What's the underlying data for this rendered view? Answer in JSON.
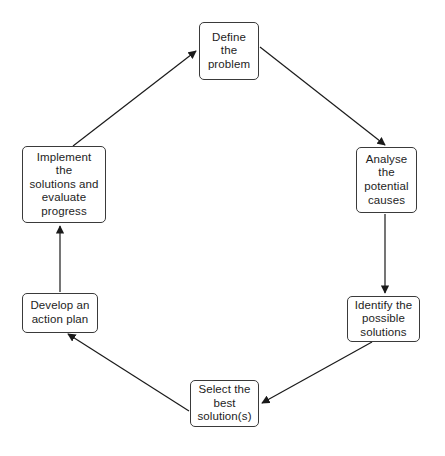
{
  "diagram": {
    "type": "cycle-flowchart",
    "background_color": "#ffffff",
    "node_border_color": "#3a3a3a",
    "arrow_color": "#1a1a1a",
    "text_color": "#1d1d1d",
    "nodes": [
      {
        "id": "define",
        "label": "Define\nthe\nproblem"
      },
      {
        "id": "analyse",
        "label": "Analyse\nthe\npotential\ncauses"
      },
      {
        "id": "identify",
        "label": "Identify the\npossible\nsolutions"
      },
      {
        "id": "select",
        "label": "Select the\nbest\nsolution(s)"
      },
      {
        "id": "develop",
        "label": "Develop an\naction plan"
      },
      {
        "id": "implement",
        "label": "Implement\nthe\nsolutions and\nevaluate\nprogress"
      }
    ],
    "edges": [
      {
        "id": "define-to-analyse",
        "from": "define",
        "to": "analyse",
        "style": "diagonal-down-right"
      },
      {
        "id": "analyse-to-identify",
        "from": "analyse",
        "to": "identify",
        "style": "vertical-down"
      },
      {
        "id": "identify-to-select",
        "from": "identify",
        "to": "select",
        "style": "diagonal-down-left"
      },
      {
        "id": "select-to-develop",
        "from": "select",
        "to": "develop",
        "style": "diagonal-up-left"
      },
      {
        "id": "develop-to-implement",
        "from": "develop",
        "to": "implement",
        "style": "vertical-up"
      },
      {
        "id": "implement-to-define",
        "from": "implement",
        "to": "define",
        "style": "diagonal-up-right"
      }
    ]
  }
}
